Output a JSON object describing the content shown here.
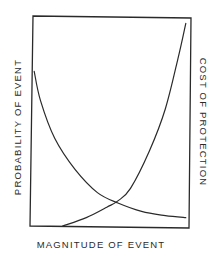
{
  "chart_data": {
    "type": "line",
    "title": "",
    "xlabel": "MAGNITUDE OF EVENT",
    "ylabel": "PROBABILITY OF EVENT",
    "ylabel_right": "COST OF PROTECTION",
    "grid": false,
    "legend": null,
    "x_ticks": [],
    "y_ticks": [],
    "x_range": [
      0,
      1
    ],
    "y_range": [
      0,
      1
    ],
    "series": [
      {
        "name": "PROBABILITY OF EVENT",
        "axis": "left",
        "trend": "decreasing",
        "x": [
          0.02,
          0.06,
          0.15,
          0.28,
          0.42,
          0.55,
          0.7,
          0.85,
          0.98
        ],
        "values": [
          0.74,
          0.6,
          0.42,
          0.27,
          0.16,
          0.11,
          0.07,
          0.05,
          0.04
        ]
      },
      {
        "name": "COST OF PROTECTION",
        "axis": "right",
        "trend": "increasing",
        "x": [
          0.2,
          0.35,
          0.48,
          0.55,
          0.63,
          0.75,
          0.85,
          0.93,
          0.98
        ],
        "values": [
          0.0,
          0.04,
          0.09,
          0.12,
          0.18,
          0.36,
          0.56,
          0.8,
          0.97
        ]
      }
    ],
    "annotations": []
  },
  "labels": {
    "left_axis": "PROBABILITY OF EVENT",
    "right_axis": "COST OF PROTECTION",
    "bottom_axis": "MAGNITUDE OF EVENT"
  },
  "colors": {
    "line": "#2a2a2a",
    "background": "#ffffff"
  }
}
